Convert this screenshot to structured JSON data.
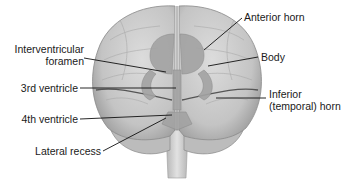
{
  "diagram": {
    "labels": [
      {
        "id": "anterior-horn",
        "text": "Anterior horn",
        "side": "right"
      },
      {
        "id": "interventricular-foramen",
        "text_line1": "Interventricular",
        "text_line2": "foramen",
        "side": "left"
      },
      {
        "id": "body",
        "text": "Body",
        "side": "right"
      },
      {
        "id": "third-ventricle",
        "text": "3rd ventricle",
        "side": "left"
      },
      {
        "id": "inferior-horn",
        "text_line1": "Inferior",
        "text_line2": "(temporal) horn",
        "side": "right"
      },
      {
        "id": "fourth-ventricle",
        "text": "4th ventricle",
        "side": "left"
      },
      {
        "id": "lateral-recess",
        "text": "Lateral recess",
        "side": "left"
      }
    ],
    "colors": {
      "brain_fill": "#c9c9c9",
      "brain_dark": "#8e8e8e",
      "ventricle_fill": "#a9a9a9",
      "line": "#111111",
      "text": "#1a1a1a"
    }
  }
}
